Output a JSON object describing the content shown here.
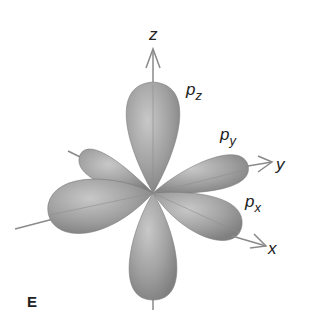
{
  "diagram": {
    "panel_label": "E",
    "axes": [
      {
        "name": "z",
        "label": "z"
      },
      {
        "name": "y",
        "label": "y"
      },
      {
        "name": "x",
        "label": "x"
      }
    ],
    "orbitals": [
      {
        "name": "pz",
        "base": "p",
        "subscript": "z"
      },
      {
        "name": "py",
        "base": "p",
        "subscript": "y"
      },
      {
        "name": "px",
        "base": "p",
        "subscript": "x"
      }
    ],
    "colors": {
      "lobe": "#9a9a9a",
      "lobe_light": "#c4c4c4",
      "lobe_dark": "#7a7a7a",
      "axis": "#8a8a8a",
      "text": "#222222"
    }
  }
}
